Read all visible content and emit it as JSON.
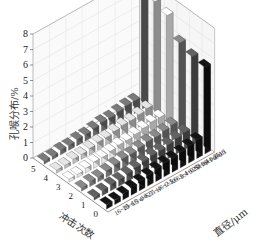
{
  "chart_data": {
    "type": "bar3d",
    "title": "",
    "ylabel": "孔喉分布/%",
    "xlabel": "冲击次数",
    "zlabel": "直径/μm",
    "ylim": [
      0,
      8
    ],
    "yticks": [
      "0",
      "1",
      "2",
      "3",
      "4",
      "5",
      "6",
      "7",
      "8"
    ],
    "impact_counts": [
      "0",
      "1",
      "2",
      "3",
      "4",
      "5"
    ],
    "diameter_bins": [
      "0~0.1",
      "0.1~0.16",
      "0.16~0.25",
      "0.25~0.4",
      "0.4~0.63",
      "0.63~1",
      "1~1.6",
      "1.6~2.5",
      "2.5~4",
      "4~6.3",
      "6.3~10",
      "10~16",
      "16~25"
    ],
    "grid": true,
    "series": [
      {
        "name": "0",
        "color": "#111111",
        "values": [
          5.6,
          1.2,
          1.1,
          1.0,
          0.9,
          0.9,
          0.8,
          0.7,
          0.6,
          0.5,
          0.4,
          0.3,
          0.3
        ]
      },
      {
        "name": "1",
        "color": "#555555",
        "values": [
          5.7,
          1.1,
          1.0,
          0.9,
          0.8,
          0.8,
          0.7,
          0.6,
          0.5,
          0.4,
          0.4,
          0.3,
          0.2
        ]
      },
      {
        "name": "2",
        "color": "#777777",
        "values": [
          6.0,
          1.0,
          0.9,
          0.8,
          0.8,
          0.7,
          0.6,
          0.6,
          0.5,
          0.4,
          0.3,
          0.3,
          0.2
        ]
      },
      {
        "name": "3",
        "color": "#f2f2f2",
        "values": [
          7.2,
          0.9,
          0.9,
          0.8,
          0.7,
          0.6,
          0.6,
          0.5,
          0.4,
          0.4,
          0.3,
          0.2,
          0.2
        ]
      },
      {
        "name": "4",
        "color": "#c8c8c8",
        "values": [
          7.5,
          0.9,
          0.8,
          0.7,
          0.7,
          0.6,
          0.5,
          0.5,
          0.4,
          0.3,
          0.3,
          0.2,
          0.2
        ]
      },
      {
        "name": "5",
        "color": "#6a6a6a",
        "values": [
          7.8,
          0.8,
          0.8,
          0.7,
          0.6,
          0.6,
          0.5,
          0.4,
          0.4,
          0.3,
          0.3,
          0.2,
          0.2
        ]
      }
    ]
  }
}
